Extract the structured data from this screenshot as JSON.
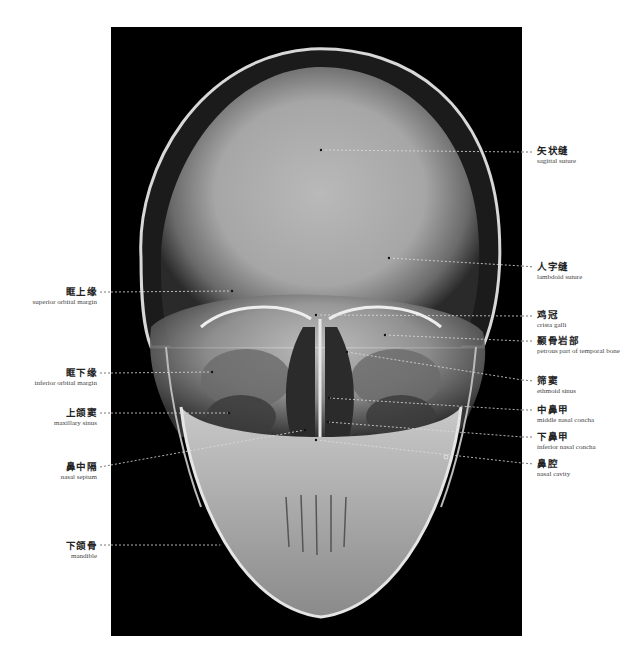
{
  "figure": {
    "background": "#ffffff",
    "image_bg": "#000000",
    "leader_color_on_image": "#dddddd",
    "leader_color_off_image": "#555555"
  },
  "labels_right": [
    {
      "id": "sagittal-suture",
      "zh": "矢状缝",
      "en": "sagittal suture",
      "point": [
        321,
        150
      ],
      "label_y": 146
    },
    {
      "id": "lambdoid-suture",
      "zh": "人字缝",
      "en": "lambdoid suture",
      "point": [
        389,
        258
      ],
      "label_y": 262
    },
    {
      "id": "crista-galli",
      "zh": "鸡冠",
      "en": "crista galli",
      "point": [
        316,
        315
      ],
      "label_y": 310
    },
    {
      "id": "petrous-part",
      "zh": "颞骨岩部",
      "en": "petrous part of temporal bone",
      "point": [
        385,
        335
      ],
      "label_y": 336
    },
    {
      "id": "ethmoid-sinus",
      "zh": "筛窦",
      "en": "ethmoid sinus",
      "point": [
        347,
        352
      ],
      "label_y": 376
    },
    {
      "id": "middle-nasal-concha",
      "zh": "中鼻甲",
      "en": "middle nasal concha",
      "point": [
        329,
        398
      ],
      "label_y": 405
    },
    {
      "id": "inferior-nasal-concha",
      "zh": "下鼻甲",
      "en": "inferior nasal concha",
      "point": [
        328,
        422
      ],
      "label_y": 432
    },
    {
      "id": "nasal-cavity",
      "zh": "鼻腔",
      "en": "nasal cavity",
      "point": [
        316,
        440
      ],
      "label_y": 459
    }
  ],
  "labels_left": [
    {
      "id": "superior-orbital-margin",
      "zh": "眶上缘",
      "en": "superior orbital margin",
      "point": [
        232,
        291
      ],
      "label_y": 287
    },
    {
      "id": "inferior-orbital-margin",
      "zh": "眶下缘",
      "en": "inferior orbital margin",
      "point": [
        212,
        372
      ],
      "label_y": 368
    },
    {
      "id": "maxillary-sinus",
      "zh": "上颌窦",
      "en": "maxillary sinus",
      "point": [
        229,
        413
      ],
      "label_y": 408
    },
    {
      "id": "nasal-septum",
      "zh": "鼻中隔",
      "en": "nasal septum",
      "point": [
        305,
        430
      ],
      "label_y": 462
    },
    {
      "id": "mandible",
      "zh": "下颌骨",
      "en": "mandible",
      "point": [
        221,
        545
      ],
      "label_y": 541
    }
  ]
}
